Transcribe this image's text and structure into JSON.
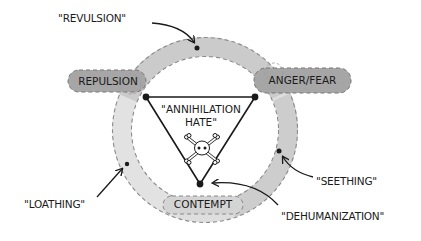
{
  "diagram": {
    "center": {
      "line1": "\"ANNIHILATION",
      "line2": "HATE\"",
      "icon": "skull-crossbones-icon"
    },
    "nodes": {
      "repulsion": "REPULSION",
      "anger_fear": "ANGER/FEAR",
      "contempt": "CONTEMPT"
    },
    "annotations": {
      "revulsion": "\"REVULSION\"",
      "seething": "\"SEETHING\"",
      "loathing": "\"LOATHING\"",
      "dehumanization": "\"DEHUMANIZATION\""
    },
    "colors": {
      "ring_light": "#dcdcdc",
      "ring_mid": "#c9c9c9",
      "pill_dark": "#a3a3a3",
      "pill_light": "#d6d6d6",
      "ink": "#1a1a1a",
      "dash": "#8a8a8a"
    }
  }
}
